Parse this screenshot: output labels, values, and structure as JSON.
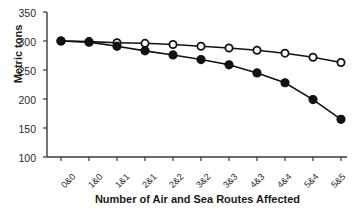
{
  "chart_data": {
    "type": "line",
    "title": "",
    "xlabel": "Number of Air and Sea Routes Affected",
    "ylabel": "Metric tons",
    "categories": [
      "0&0",
      "1&0",
      "1&1",
      "2&1",
      "2&2",
      "3&2",
      "3&3",
      "4&3",
      "4&4",
      "5&4",
      "5&5"
    ],
    "ylim": [
      100,
      350
    ],
    "yticks": [
      100,
      150,
      200,
      250,
      300,
      350
    ],
    "grid": false,
    "legend": "none",
    "series": [
      {
        "name": "open-circles",
        "marker": "open-circle",
        "values": [
          300,
          299,
          297,
          296,
          294,
          291,
          288,
          284,
          279,
          272,
          263
        ]
      },
      {
        "name": "filled-circles",
        "marker": "filled-circle",
        "values": [
          300,
          298,
          291,
          283,
          276,
          268,
          259,
          245,
          228,
          199,
          165
        ]
      }
    ]
  },
  "axis": {
    "y_title": "Metric tons",
    "x_title": "Number of Air and Sea Routes Affected",
    "y_tick_labels": [
      "350",
      "300",
      "250",
      "200",
      "150",
      "100"
    ],
    "x_tick_labels": [
      "0&0",
      "1&0",
      "1&1",
      "2&1",
      "2&2",
      "3&2",
      "3&3",
      "4&3",
      "4&4",
      "5&4",
      "5&5"
    ]
  },
  "colors": {
    "line": "#111111",
    "marker_fill": "#111111",
    "marker_open": "#ffffff",
    "axis": "#3a3a3a",
    "text": "#1a1a1a"
  }
}
